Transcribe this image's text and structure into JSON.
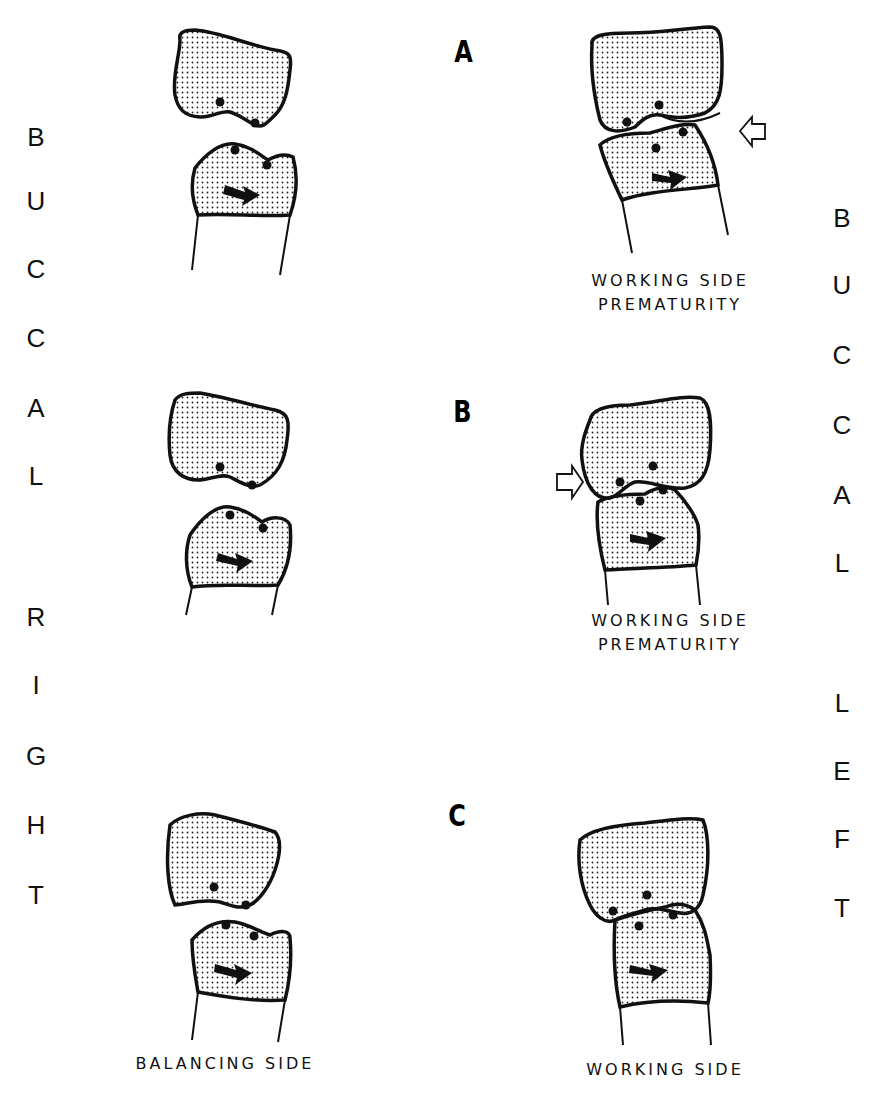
{
  "figure": {
    "left_side_label": [
      "B",
      "U",
      "C",
      "C",
      "A",
      "L",
      "R",
      "I",
      "G",
      "H",
      "T"
    ],
    "right_side_label": [
      "B",
      "U",
      "C",
      "C",
      "A",
      "L",
      "L",
      "E",
      "F",
      "T"
    ],
    "rows": [
      {
        "label": "A",
        "left_caption": "",
        "right_caption": [
          "WORKING SIDE",
          "PREMATURITY"
        ],
        "right_arrow": "hollow-arrow-left"
      },
      {
        "label": "B",
        "left_caption": "",
        "right_caption": [
          "WORKING SIDE",
          "PREMATURITY"
        ],
        "right_arrow": "hollow-arrow-right"
      },
      {
        "label": "C",
        "left_caption": "BALANCING SIDE",
        "right_caption": [
          "WORKING SIDE"
        ],
        "right_arrow": ""
      }
    ],
    "colors": {
      "ink": "#111111",
      "stipple": "#222222",
      "background": "#ffffff"
    }
  }
}
